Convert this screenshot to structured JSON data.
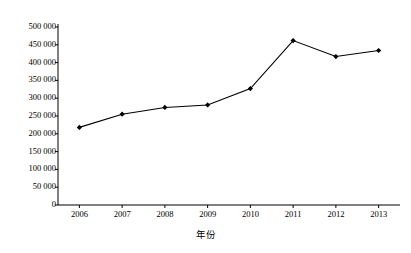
{
  "chart_data": {
    "type": "line",
    "title": "",
    "xlabel": "年份",
    "ylabel": "废气排放量（亿标准立方米）",
    "categories": [
      "2006",
      "2007",
      "2008",
      "2009",
      "2010",
      "2011",
      "2012",
      "2013"
    ],
    "values": [
      218000,
      255000,
      274000,
      281000,
      327000,
      462000,
      417000,
      434000
    ],
    "series": [
      {
        "name": "废气排放量",
        "values": [
          218000,
          255000,
          274000,
          281000,
          327000,
          462000,
          417000,
          434000
        ]
      }
    ],
    "ylim": [
      0,
      500000
    ],
    "ytick_values": [
      0,
      50000,
      100000,
      150000,
      200000,
      250000,
      300000,
      350000,
      400000,
      450000,
      500000
    ],
    "ytick_labels": [
      "0",
      "50 000",
      "100 000",
      "150 000",
      "200 000",
      "250 000",
      "300 000",
      "350 000",
      "400 000",
      "450 000",
      "500 000"
    ],
    "xtick_labels": [
      "2006",
      "2007",
      "2008",
      "2009",
      "2010",
      "2011",
      "2012",
      "2013"
    ],
    "grid": false,
    "legend": null,
    "marker": "diamond",
    "line_color": "#000000",
    "marker_color": "#000000",
    "axis_color": "#000000",
    "background_color": "#ffffff"
  }
}
